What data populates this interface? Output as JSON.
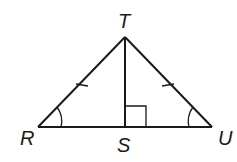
{
  "diagram": {
    "type": "geometry-triangle",
    "vertices": {
      "top": "T",
      "left": "R",
      "right": "U",
      "foot": "S"
    },
    "marks": {
      "congruent_sides": [
        "TR",
        "TU"
      ],
      "congruent_angles": [
        "R",
        "U"
      ],
      "right_angle_at": "S"
    }
  }
}
